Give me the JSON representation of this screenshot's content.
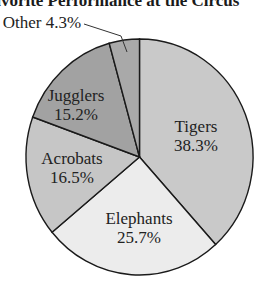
{
  "chart_data": {
    "type": "pie",
    "title": "Favorite Performance at the Circus",
    "categories": [
      "Tigers",
      "Elephants",
      "Acrobats",
      "Jugglers",
      "Other"
    ],
    "values": [
      38.3,
      25.7,
      16.5,
      15.2,
      4.3
    ],
    "unit": "%",
    "start_angle": "12 o'clock",
    "direction": "clockwise",
    "colors": [
      "#c9c9c9",
      "#ececec",
      "#c6c6c6",
      "#a2a2a2",
      "#a9a9a9"
    ],
    "labels": [
      {
        "name": "Tigers",
        "pct": "38.3%"
      },
      {
        "name": "Elephants",
        "pct": "25.7%"
      },
      {
        "name": "Acrobats",
        "pct": "16.5%"
      },
      {
        "name": "Jugglers",
        "pct": "15.2%"
      },
      {
        "name": "Other",
        "pct": "4.3%",
        "external": true,
        "text": "Other 4.3%"
      }
    ],
    "legend": "none"
  }
}
